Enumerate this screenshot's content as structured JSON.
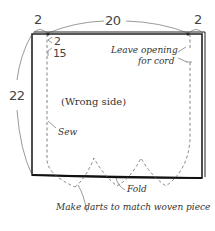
{
  "diagram": {
    "type": "sewing-pattern",
    "dimensions": {
      "width": "20",
      "height": "22",
      "left_margin": "2",
      "right_margin": "2",
      "top_seam": "2",
      "opening": "1.5",
      "opening_label": "15"
    },
    "labels": {
      "leave_opening": "Leave opening",
      "for_cord": "for cord",
      "wrong_side": "(Wrong side)",
      "sew": "Sew",
      "fold": "Fold",
      "make_darts": "Make darts to match woven piece"
    },
    "colors": {
      "outline": "#222222",
      "stitch": "#666666",
      "leader": "#555555"
    }
  }
}
